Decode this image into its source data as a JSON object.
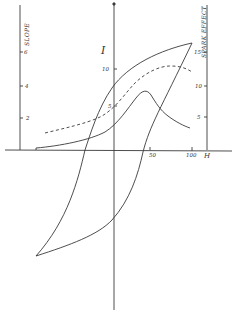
{
  "figure": {
    "type": "hysteresis-diagram",
    "axes": {
      "h_axis": {
        "label": "H",
        "ticks": [
          "50",
          "100"
        ]
      },
      "i_axis": {
        "label": "I",
        "ticks": [
          "10",
          "5"
        ]
      },
      "slope_axis": {
        "label": "SLOPE",
        "ticks": [
          "6",
          "4",
          "2"
        ]
      },
      "spark_axis": {
        "label": "SPARK EFFECT",
        "ticks": [
          "15",
          "10",
          "5"
        ]
      }
    },
    "curves": [
      {
        "name": "hysteresis-loop",
        "style": "solid"
      },
      {
        "name": "slope-curve",
        "style": "solid"
      },
      {
        "name": "spark-effect-curve",
        "style": "dashed"
      }
    ],
    "line_color": "#3a3a3a"
  }
}
